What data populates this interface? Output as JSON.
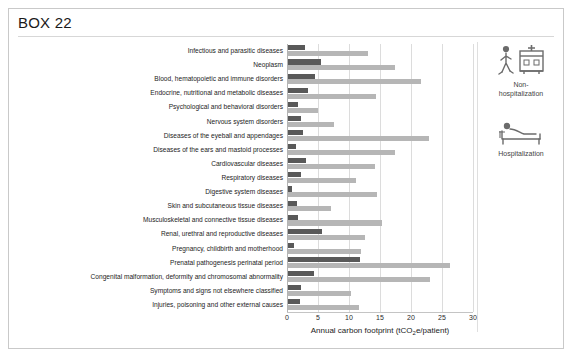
{
  "box": {
    "title": "BOX 22"
  },
  "legend": {
    "items": [
      {
        "icon": "walking-person-hospital-building-icon",
        "label": "Non-\nhospitalization",
        "color": "#b6b6b6"
      },
      {
        "icon": "patient-in-bed-icon",
        "label": "Hospitalization",
        "color": "#595959"
      }
    ]
  },
  "chart_data": {
    "type": "bar",
    "orientation": "horizontal",
    "title": "",
    "xlabel": "Annual carbon footprint (tCO2e/patient)",
    "ylabel": "",
    "xlim": [
      0,
      30
    ],
    "xticks": [
      0,
      5,
      10,
      15,
      20,
      25,
      30
    ],
    "grid": true,
    "legend_position": "right",
    "categories": [
      "Infectious and parasitic diseases",
      "Neoplasm",
      "Blood, hematopoietic and immune disorders",
      "Endocrine, nutritional and metabolic diseases",
      "Psychological and behavioral disorders",
      "Nervous system disorders",
      "Diseases of the eyeball and appendages",
      "Diseases of the ears and mastoid processes",
      "Cardiovascular diseases",
      "Respiratory diseases",
      "Digestive system diseases",
      "Skin and subcutaneous tissue diseases",
      "Musculoskeletal and connective tissue diseases",
      "Renal, urethral and reproductive diseases",
      "Pregnancy, childbirth and motherhood",
      "Prenatal pathogenesis perinatal period",
      "Congenital malformation, deformity and chromosomal abnormality",
      "Symptoms and signs not elsewhere classified",
      "Injuries, poisoning and other external causes"
    ],
    "series": [
      {
        "name": "Hospitalization",
        "color": "#595959",
        "values": [
          2.7,
          5.3,
          4.4,
          3.2,
          1.6,
          2.1,
          2.4,
          1.3,
          2.9,
          2.1,
          0.7,
          1.5,
          1.6,
          5.5,
          1.0,
          11.6,
          4.2,
          2.1,
          1.9
        ]
      },
      {
        "name": "Non-hospitalization",
        "color": "#b6b6b6",
        "values": [
          12.9,
          17.3,
          21.4,
          14.2,
          4.8,
          7.4,
          22.7,
          17.3,
          14.0,
          11.0,
          14.4,
          7.0,
          15.2,
          12.4,
          11.8,
          26.1,
          22.9,
          10.2,
          11.4
        ]
      }
    ]
  }
}
